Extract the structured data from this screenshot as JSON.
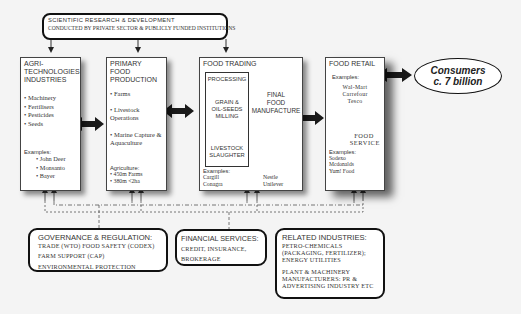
{
  "research": {
    "line1": "SCIENTIFIC RESEARCH & DEVELOPMENT",
    "line2": "CONDUCTED BY PRIVATE SECTOR & PUBLICLY FUNDED INSTITUTIONS"
  },
  "agri": {
    "title_lines": [
      "AGRI-",
      "TECHNOLOGIES",
      "INDUSTRIES"
    ],
    "items": [
      "Machinery",
      "Fertilisers",
      "Pesticides",
      "Seeds"
    ],
    "examples_label": "Examples:",
    "examples": [
      "John Deer",
      "Monsanto",
      "Bayer"
    ]
  },
  "primary": {
    "title_lines": [
      "PRIMARY FOOD",
      "PRODUCTION"
    ],
    "items": [
      "Farms",
      "Livestock Operations",
      "Marine Capture & Aquaculture"
    ],
    "agri_label": "Agriculture:",
    "agri_stats": [
      "450m Farms",
      "380m <2ha"
    ]
  },
  "trading": {
    "title": "FOOD TRADING",
    "processing": "PROCESSING",
    "grain_lines": [
      "GRAIN &",
      "OIL-SEEDS",
      "MILLING"
    ],
    "livestock_lines": [
      "LIVESTOCK",
      "SLAUGHTER"
    ],
    "final_lines": [
      "FINAL",
      "FOOD",
      "MANUFACTURE"
    ],
    "examples_label": "Examples:",
    "examples_left": [
      "Cargill",
      "Conagra"
    ],
    "examples_right": [
      "Nestle",
      "Unilever"
    ]
  },
  "retail": {
    "title": "FOOD RETAIL",
    "examples_label": "Examples:",
    "examples": [
      "Wal-Mart",
      "Carrefour",
      "Tesco"
    ],
    "service_lines": [
      "FOOD",
      "SERVICE"
    ],
    "service_examples_label": "Examples:",
    "service_examples": [
      "Sodexo",
      "Mcdonalds",
      "Yum! Food"
    ]
  },
  "consumers": {
    "line1": "Consumers",
    "line2": "c. 7 billion"
  },
  "governance": {
    "title": "GOVERNANCE & REGULATION:",
    "lines": [
      "TRADE (WTO) FOOD SAFETY (CODEX)",
      "FARM SUPPORT (CAP)",
      "ENVIRONMENTAL PROTECTION"
    ]
  },
  "financial": {
    "title": "FINANCIAL SERVICES:",
    "lines": [
      "CREDIT, INSURANCE,",
      "BROKERAGE"
    ]
  },
  "related": {
    "title": "RELATED INDUSTRIES:",
    "lines": [
      "PETRO-CHEMICALS",
      "(PACKAGING, FERTILIZER);",
      "ENERGY UTILITIES"
    ],
    "lines2": [
      "PLANT & MACHINERY",
      "MANUFACTURERS: PR &",
      "ADVERTISING INDUSTRY ETC"
    ]
  },
  "colors": {
    "arrow": "#222222",
    "border": "#444444",
    "background": "#f4f4f4"
  }
}
